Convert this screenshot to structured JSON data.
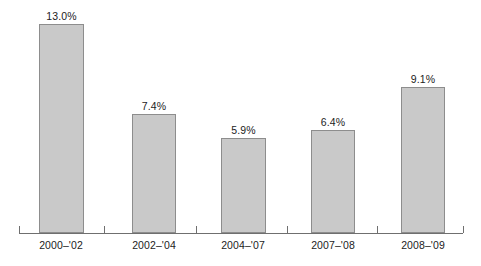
{
  "chart_data": {
    "type": "bar",
    "title": "",
    "subtitle": "",
    "xlabel": "",
    "ylabel": "",
    "categories": [
      "2000–'02",
      "2002–'04",
      "2004–'07",
      "2007–'08",
      "2008–'09"
    ],
    "values": [
      13.0,
      7.4,
      5.9,
      6.4,
      9.1
    ],
    "value_labels": [
      "13.0%",
      "7.4%",
      "5.9%",
      "6.4%",
      "9.1%"
    ],
    "ylim": [
      0,
      13.0
    ],
    "grid": false,
    "legend": null,
    "legend_position": "none",
    "annotations": [],
    "bar_fill_color": "#c9c9c9",
    "bar_border_color": "#8d8d8d",
    "axis_color": "#6f6f6f",
    "text_color": "#1c1c1c"
  },
  "geometry": {
    "baseline_y": 233,
    "max_bar_height": 209,
    "bars": [
      {
        "left": 39,
        "width": 45
      },
      {
        "left": 132,
        "width": 44
      },
      {
        "left": 221,
        "width": 45
      },
      {
        "left": 311,
        "width": 44
      },
      {
        "left": 401,
        "width": 44
      }
    ],
    "ticks": [
      19,
      104,
      196,
      287,
      377,
      463
    ],
    "label_centers": [
      61,
      154,
      243,
      333,
      423
    ]
  }
}
